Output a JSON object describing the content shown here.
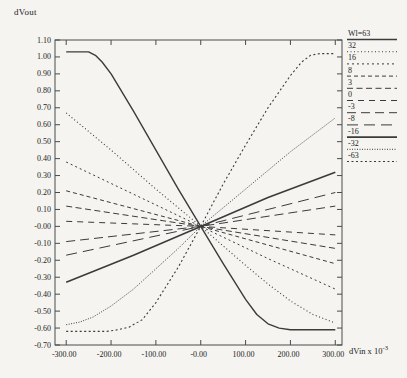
{
  "figure": {
    "y_axis_title": "dVout",
    "x_axis_title_base": "dVin x 10",
    "x_axis_title_exp": "-3"
  },
  "chart_data": {
    "type": "line",
    "title": "",
    "xlabel": "dVin x 10^-3",
    "ylabel": "dVout",
    "xlim": [
      -325,
      315
    ],
    "ylim": [
      -0.7,
      1.1
    ],
    "grid": false,
    "legend_position": "right-outside",
    "x_ticks": [
      -300,
      -200,
      -100,
      0,
      100,
      200,
      300
    ],
    "x_tick_labels": [
      "-300.00",
      "-200.00",
      "-100.00",
      "-0.00",
      "100.00",
      "200.00",
      "300.00"
    ],
    "y_ticks": [
      1.1,
      1.0,
      0.9,
      0.8,
      0.7,
      0.6,
      0.5,
      0.4,
      0.3,
      0.2,
      0.1,
      0.0,
      -0.1,
      -0.2,
      -0.3,
      -0.4,
      -0.5,
      -0.6,
      -0.7
    ],
    "y_tick_labels": [
      "1.10",
      "1.00",
      "0.90",
      "0.80",
      "0.70",
      "0.60",
      "0.50",
      "0.40",
      "0.30",
      "0.20",
      "0.10",
      "-0.00",
      "-0.10",
      "-0.20",
      "-0.30",
      "-0.40",
      "-0.50",
      "-0.60",
      "-0.70"
    ],
    "line_color": "#3b3b3b",
    "series": [
      {
        "name": "Wl=63",
        "dash": "",
        "width": 1.4,
        "points": [
          [
            -300,
            1.03
          ],
          [
            -250,
            1.03
          ],
          [
            -235,
            1.01
          ],
          [
            -220,
            0.97
          ],
          [
            -200,
            0.9
          ],
          [
            -150,
            0.68
          ],
          [
            -100,
            0.45
          ],
          [
            -50,
            0.22
          ],
          [
            0,
            0.0
          ],
          [
            50,
            -0.22
          ],
          [
            100,
            -0.43
          ],
          [
            125,
            -0.52
          ],
          [
            150,
            -0.575
          ],
          [
            175,
            -0.6
          ],
          [
            200,
            -0.61
          ],
          [
            300,
            -0.61
          ]
        ]
      },
      {
        "name": "32",
        "dash": "1 2.5",
        "width": 1.1,
        "points": [
          [
            -300,
            0.67
          ],
          [
            -200,
            0.45
          ],
          [
            -100,
            0.22
          ],
          [
            0,
            0.0
          ],
          [
            100,
            -0.23
          ],
          [
            150,
            -0.34
          ],
          [
            200,
            -0.44
          ],
          [
            250,
            -0.52
          ],
          [
            300,
            -0.57
          ]
        ]
      },
      {
        "name": "16",
        "dash": "2 3",
        "width": 1,
        "points": [
          [
            -300,
            0.38
          ],
          [
            -150,
            0.19
          ],
          [
            0,
            0.0
          ],
          [
            150,
            -0.19
          ],
          [
            300,
            -0.37
          ]
        ]
      },
      {
        "name": "8",
        "dash": "4 3",
        "width": 1,
        "points": [
          [
            -300,
            0.21
          ],
          [
            0,
            0.0
          ],
          [
            300,
            -0.22
          ]
        ]
      },
      {
        "name": "3",
        "dash": "6 3.5",
        "width": 1,
        "points": [
          [
            -300,
            0.12
          ],
          [
            0,
            0.0
          ],
          [
            300,
            -0.13
          ]
        ]
      },
      {
        "name": "0",
        "dash": "6 5",
        "width": 1,
        "points": [
          [
            -300,
            0.03
          ],
          [
            0,
            0.0
          ],
          [
            300,
            -0.05
          ]
        ]
      },
      {
        "name": "-3",
        "dash": "9 5",
        "width": 1,
        "points": [
          [
            -300,
            -0.09
          ],
          [
            0,
            0.0
          ],
          [
            300,
            0.12
          ]
        ]
      },
      {
        "name": "-8",
        "dash": "11 6",
        "width": 1,
        "points": [
          [
            -300,
            -0.17
          ],
          [
            0,
            0.0
          ],
          [
            300,
            0.2
          ]
        ]
      },
      {
        "name": "-16",
        "dash": "",
        "width": 1.6,
        "points": [
          [
            -300,
            -0.33
          ],
          [
            -150,
            -0.17
          ],
          [
            0,
            0.0
          ],
          [
            150,
            0.17
          ],
          [
            300,
            0.32
          ]
        ]
      },
      {
        "name": "-32",
        "dash": "1 1.5",
        "width": 1,
        "points": [
          [
            -300,
            -0.58
          ],
          [
            -270,
            -0.565
          ],
          [
            -240,
            -0.535
          ],
          [
            -200,
            -0.47
          ],
          [
            -150,
            -0.37
          ],
          [
            -100,
            -0.25
          ],
          [
            -50,
            -0.13
          ],
          [
            0,
            0.0
          ],
          [
            100,
            0.22
          ],
          [
            200,
            0.44
          ],
          [
            300,
            0.64
          ]
        ]
      },
      {
        "name": "-63",
        "dash": "2 2.5",
        "width": 1.1,
        "points": [
          [
            -300,
            -0.62
          ],
          [
            -210,
            -0.62
          ],
          [
            -185,
            -0.61
          ],
          [
            -160,
            -0.595
          ],
          [
            -130,
            -0.55
          ],
          [
            -100,
            -0.45
          ],
          [
            -50,
            -0.24
          ],
          [
            0,
            0.0
          ],
          [
            50,
            0.25
          ],
          [
            100,
            0.48
          ],
          [
            150,
            0.7
          ],
          [
            200,
            0.89
          ],
          [
            225,
            0.97
          ],
          [
            245,
            1.01
          ],
          [
            265,
            1.02
          ],
          [
            300,
            1.02
          ]
        ]
      }
    ]
  }
}
